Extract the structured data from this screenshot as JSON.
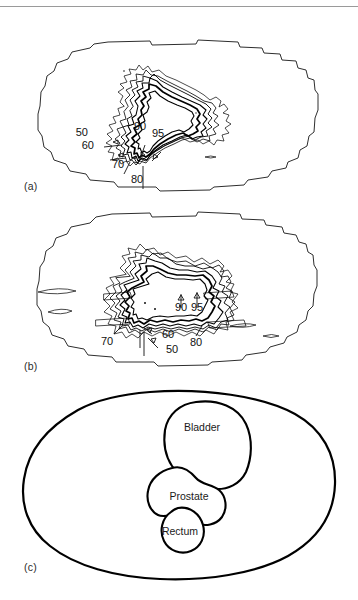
{
  "figure": {
    "type": "radiotherapy-isodose-figure",
    "panels": [
      {
        "id": "a",
        "caption": "(a)",
        "description": "transverse isodose distribution, stair-stepped body outline",
        "dose_labels": [
          {
            "value": "50",
            "x": 90,
            "y": 136
          },
          {
            "value": "60",
            "x": 96,
            "y": 149
          },
          {
            "value": "70",
            "x": 118,
            "y": 167
          },
          {
            "value": "80",
            "x": 136,
            "y": 182
          },
          {
            "value": "90",
            "x": 140,
            "y": 130
          },
          {
            "value": "95",
            "x": 157,
            "y": 136
          }
        ]
      },
      {
        "id": "b",
        "caption": "(b)",
        "description": "sagittal isodose distribution with low-dose streaks",
        "dose_labels": [
          {
            "value": "70",
            "x": 107,
            "y": 341
          },
          {
            "value": "60",
            "x": 160,
            "y": 334
          },
          {
            "value": "50",
            "x": 165,
            "y": 349
          },
          {
            "value": "80",
            "x": 196,
            "y": 342
          },
          {
            "value": "90",
            "x": 180,
            "y": 307
          },
          {
            "value": "95",
            "x": 196,
            "y": 307
          }
        ]
      },
      {
        "id": "c",
        "caption": "(c)",
        "description": "anatomical outline with organ structures",
        "organs": [
          {
            "name": "Bladder",
            "x": 199,
            "y": 427
          },
          {
            "name": "Prostate",
            "x": 191,
            "y": 497
          },
          {
            "name": "Rectum",
            "x": 178,
            "y": 533
          }
        ]
      }
    ]
  },
  "colors": {
    "ink": "#000000",
    "outline": "#2e2e2e",
    "caption": "#2b2b2b",
    "background": "#ffffff",
    "rule": "#9a9a9a"
  }
}
